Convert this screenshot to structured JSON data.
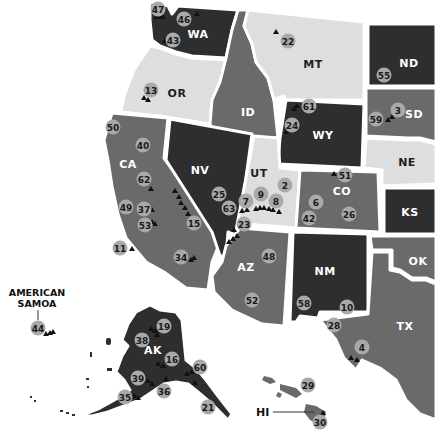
{
  "map": {
    "colors": {
      "dark": "#2e2e2e",
      "mid": "#6a6a6a",
      "light": "#dedede",
      "marker": "#a9a9a9",
      "peak": "#111111",
      "border": "#ffffff"
    },
    "states": [
      {
        "code": "WA",
        "label": "WA",
        "shade": "dark"
      },
      {
        "code": "OR",
        "label": "OR",
        "shade": "light"
      },
      {
        "code": "CA",
        "label": "CA",
        "shade": "mid"
      },
      {
        "code": "ID",
        "label": "ID",
        "shade": "mid"
      },
      {
        "code": "NV",
        "label": "NV",
        "shade": "dark"
      },
      {
        "code": "MT",
        "label": "MT",
        "shade": "light"
      },
      {
        "code": "WY",
        "label": "WY",
        "shade": "dark"
      },
      {
        "code": "UT",
        "label": "UT",
        "shade": "light"
      },
      {
        "code": "CO",
        "label": "CO",
        "shade": "mid"
      },
      {
        "code": "AZ",
        "label": "AZ",
        "shade": "mid"
      },
      {
        "code": "NM",
        "label": "NM",
        "shade": "dark"
      },
      {
        "code": "ND",
        "label": "ND",
        "shade": "dark"
      },
      {
        "code": "SD",
        "label": "SD",
        "shade": "mid"
      },
      {
        "code": "NE",
        "label": "NE",
        "shade": "light"
      },
      {
        "code": "KS",
        "label": "KS",
        "shade": "dark"
      },
      {
        "code": "OK",
        "label": "OK",
        "shade": "mid"
      },
      {
        "code": "TX",
        "label": "TX",
        "shade": "mid"
      },
      {
        "code": "AK",
        "label": "AK",
        "shade": "dark"
      },
      {
        "code": "HI",
        "label": "HI",
        "shade": "mid"
      }
    ],
    "callouts": {
      "american_samoa": "AMERICAN\nSAMOA",
      "american_samoa_line1": "AMERICAN",
      "american_samoa_line2": "SAMOA",
      "hawaii": "HI"
    },
    "markers": [
      {
        "num": "47",
        "x": 158,
        "y": 9
      },
      {
        "num": "46",
        "x": 184,
        "y": 19
      },
      {
        "num": "43",
        "x": 173,
        "y": 40
      },
      {
        "num": "13",
        "x": 151,
        "y": 90
      },
      {
        "num": "50",
        "x": 113,
        "y": 127
      },
      {
        "num": "40",
        "x": 143,
        "y": 145
      },
      {
        "num": "62",
        "x": 144,
        "y": 179
      },
      {
        "num": "49",
        "x": 126,
        "y": 207
      },
      {
        "num": "37",
        "x": 144,
        "y": 209
      },
      {
        "num": "53",
        "x": 145,
        "y": 225
      },
      {
        "num": "11",
        "x": 120,
        "y": 248
      },
      {
        "num": "15",
        "x": 194,
        "y": 223
      },
      {
        "num": "34",
        "x": 181,
        "y": 257
      },
      {
        "num": "25",
        "x": 219,
        "y": 194
      },
      {
        "num": "63",
        "x": 229,
        "y": 208
      },
      {
        "num": "7",
        "x": 246,
        "y": 201
      },
      {
        "num": "9",
        "x": 261,
        "y": 194
      },
      {
        "num": "8",
        "x": 276,
        "y": 201
      },
      {
        "num": "2",
        "x": 285,
        "y": 185
      },
      {
        "num": "23",
        "x": 244,
        "y": 224
      },
      {
        "num": "48",
        "x": 269,
        "y": 256
      },
      {
        "num": "52",
        "x": 252,
        "y": 300
      },
      {
        "num": "22",
        "x": 288,
        "y": 41
      },
      {
        "num": "61",
        "x": 309,
        "y": 106
      },
      {
        "num": "24",
        "x": 292,
        "y": 125
      },
      {
        "num": "55",
        "x": 384,
        "y": 75
      },
      {
        "num": "3",
        "x": 398,
        "y": 110
      },
      {
        "num": "59",
        "x": 376,
        "y": 119
      },
      {
        "num": "51",
        "x": 345,
        "y": 175
      },
      {
        "num": "6",
        "x": 316,
        "y": 202
      },
      {
        "num": "42",
        "x": 309,
        "y": 218
      },
      {
        "num": "26",
        "x": 349,
        "y": 214
      },
      {
        "num": "58",
        "x": 304,
        "y": 303
      },
      {
        "num": "10",
        "x": 347,
        "y": 307
      },
      {
        "num": "28",
        "x": 334,
        "y": 325
      },
      {
        "num": "4",
        "x": 362,
        "y": 347
      },
      {
        "num": "44",
        "x": 38,
        "y": 328
      },
      {
        "num": "19",
        "x": 164,
        "y": 326
      },
      {
        "num": "38",
        "x": 142,
        "y": 340
      },
      {
        "num": "16",
        "x": 172,
        "y": 359
      },
      {
        "num": "60",
        "x": 200,
        "y": 367
      },
      {
        "num": "39",
        "x": 138,
        "y": 378
      },
      {
        "num": "36",
        "x": 164,
        "y": 391
      },
      {
        "num": "35",
        "x": 125,
        "y": 397
      },
      {
        "num": "21",
        "x": 208,
        "y": 407
      },
      {
        "num": "29",
        "x": 308,
        "y": 385
      },
      {
        "num": "30",
        "x": 320,
        "y": 422
      }
    ]
  }
}
